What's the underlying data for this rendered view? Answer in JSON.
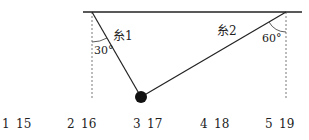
{
  "diagram": {
    "string1_label": "糸1",
    "string2_label": "糸2",
    "angle1": "30°",
    "angle2": "60°"
  },
  "options": [
    {
      "num": "1",
      "value": "15"
    },
    {
      "num": "2",
      "value": "16"
    },
    {
      "num": "3",
      "value": "17"
    },
    {
      "num": "4",
      "value": "18"
    },
    {
      "num": "5",
      "value": "19"
    }
  ]
}
